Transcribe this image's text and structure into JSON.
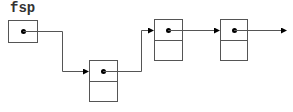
{
  "diagram": {
    "type": "linked-list",
    "variable_label": "fsp",
    "colors": {
      "line": "#555555",
      "dot": "#000000",
      "background": "#ffffff"
    },
    "nodes": [
      {
        "id": "fsp-pointer",
        "kind": "pointer-cell",
        "next": "node-1"
      },
      {
        "id": "node-1",
        "kind": "list-node",
        "fields": [
          "next",
          "data"
        ],
        "next": "node-2"
      },
      {
        "id": "node-2",
        "kind": "list-node",
        "fields": [
          "next",
          "data"
        ],
        "next": "node-3"
      },
      {
        "id": "node-3",
        "kind": "list-node",
        "fields": [
          "next",
          "data"
        ],
        "next": "continues"
      }
    ]
  }
}
